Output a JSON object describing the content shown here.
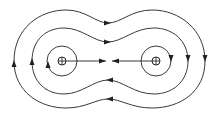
{
  "diagram": {
    "title": "Field lines between two equal charges",
    "charges": [
      {
        "label": "left charge",
        "symbol": "⊕",
        "x": 62,
        "y": 61
      },
      {
        "label": "right charge",
        "symbol": "⊕",
        "x": 156,
        "y": 61
      }
    ],
    "colors": {
      "line": "#3a3a3a",
      "arrow": "#222222",
      "background": "#ffffff"
    },
    "loops": [
      "inner circle left",
      "inner circle right",
      "middle loop",
      "outer loop"
    ],
    "arrow_directions": {
      "top_curves": "right",
      "bottom_curves": "left",
      "left_side": "up",
      "right_side": "down",
      "left_axis": "right",
      "right_axis": "left"
    }
  }
}
